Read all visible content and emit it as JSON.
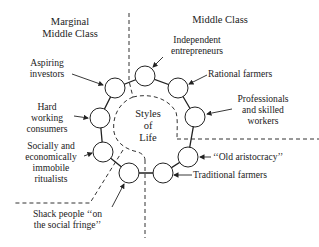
{
  "diagram": {
    "regions": {
      "left_header": [
        "Marginal",
        "Middle Class"
      ],
      "right_header": "Middle Class"
    },
    "center_label": [
      "Styles",
      "of",
      "Life"
    ],
    "nodes": [
      {
        "id": "aspiring-investors",
        "label": [
          "Aspiring",
          "investors"
        ]
      },
      {
        "id": "independent-entrepreneurs",
        "label": [
          "Independent",
          "entrepreneurs"
        ]
      },
      {
        "id": "rational-farmers",
        "label": [
          "Rational farmers"
        ]
      },
      {
        "id": "professionals",
        "label": [
          "Professionals",
          "and skilled",
          "workers"
        ]
      },
      {
        "id": "old-aristocracy",
        "label": [
          "‘‘Old aristocracy’’"
        ]
      },
      {
        "id": "traditional-farmers",
        "label": [
          "Traditional farmers"
        ]
      },
      {
        "id": "shack-people",
        "label": [
          "Shack people ‘‘on",
          "the social fringe’’"
        ]
      },
      {
        "id": "ritualists",
        "label": [
          "Socially and",
          "economically",
          "immobile",
          "ritualists"
        ]
      },
      {
        "id": "hard-working-consumers",
        "label": [
          "Hard",
          "working",
          "consumers"
        ]
      }
    ],
    "colors": {
      "stroke": "#222222",
      "background": "#ffffff"
    }
  }
}
